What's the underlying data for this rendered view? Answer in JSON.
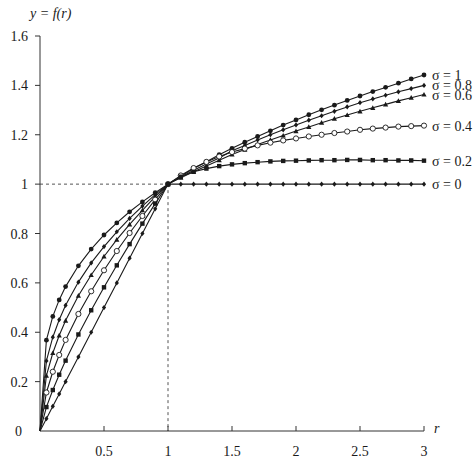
{
  "chart_data": {
    "type": "line",
    "title": "",
    "ylabel": "y = f(r)",
    "xlabel": "r",
    "xlim": [
      0,
      3
    ],
    "ylim": [
      0,
      1.6
    ],
    "x_ticks": [
      0.5,
      1,
      1.5,
      2,
      2.5,
      3
    ],
    "x_tick_labels": [
      "0.5",
      "1",
      "1.5",
      "2",
      "2.5",
      "3"
    ],
    "y_ticks": [
      0,
      0.2,
      0.4,
      0.6,
      0.8,
      1,
      1.2,
      1.4,
      1.6
    ],
    "y_tick_labels": [
      "0",
      "0.2",
      "0.4",
      "0.6",
      "0.8",
      "1",
      "1.2",
      "1.4",
      "1.6"
    ],
    "grid": false,
    "reference_lines": [
      {
        "orientation": "horizontal",
        "value": 1,
        "style": "dashed"
      },
      {
        "orientation": "vertical",
        "value": 1,
        "style": "dashed"
      }
    ],
    "legend_position": "right-end-of-lines",
    "x": [
      0,
      0.05,
      0.1,
      0.15,
      0.2,
      0.3,
      0.4,
      0.5,
      0.6,
      0.7,
      0.8,
      0.9,
      1.0,
      1.1,
      1.2,
      1.3,
      1.4,
      1.5,
      1.6,
      1.7,
      1.8,
      1.9,
      2.0,
      2.1,
      2.2,
      2.3,
      2.4,
      2.5,
      2.6,
      2.7,
      2.8,
      2.9,
      3.0
    ],
    "series": [
      {
        "name": "σ = 1",
        "marker": "filled-circle",
        "values": [
          0,
          0.368,
          0.464,
          0.531,
          0.585,
          0.669,
          0.737,
          0.794,
          0.843,
          0.888,
          0.928,
          0.965,
          1,
          1.032,
          1.063,
          1.091,
          1.119,
          1.145,
          1.17,
          1.193,
          1.216,
          1.239,
          1.26,
          1.281,
          1.301,
          1.32,
          1.339,
          1.357,
          1.375,
          1.392,
          1.409,
          1.426,
          1.442
        ]
      },
      {
        "name": "σ = 0.8",
        "marker": "filled-diamond",
        "values": [
          0,
          0.284,
          0.38,
          0.451,
          0.509,
          0.603,
          0.681,
          0.747,
          0.807,
          0.861,
          0.911,
          0.957,
          1,
          1.029,
          1.056,
          1.081,
          1.106,
          1.135,
          1.157,
          1.179,
          1.2,
          1.22,
          1.24,
          1.259,
          1.277,
          1.295,
          1.313,
          1.33,
          1.345,
          1.36,
          1.374,
          1.387,
          1.4
        ]
      },
      {
        "name": "σ = 0.6",
        "marker": "filled-triangle",
        "values": [
          0,
          0.224,
          0.316,
          0.387,
          0.447,
          0.548,
          0.632,
          0.707,
          0.775,
          0.837,
          0.894,
          0.949,
          1,
          1.026,
          1.05,
          1.073,
          1.097,
          1.12,
          1.14,
          1.16,
          1.179,
          1.197,
          1.215,
          1.232,
          1.249,
          1.265,
          1.28,
          1.295,
          1.309,
          1.323,
          1.337,
          1.35,
          1.363
        ]
      },
      {
        "name": "σ = 0.4",
        "marker": "open-circle",
        "values": [
          0,
          0.156,
          0.24,
          0.308,
          0.369,
          0.474,
          0.566,
          0.651,
          0.729,
          0.802,
          0.871,
          0.937,
          1,
          1.035,
          1.065,
          1.09,
          1.112,
          1.13,
          1.144,
          1.157,
          1.168,
          1.177,
          1.185,
          1.193,
          1.2,
          1.207,
          1.213,
          1.22,
          1.225,
          1.229,
          1.233,
          1.235,
          1.237
        ]
      },
      {
        "name": "σ = 0.2",
        "marker": "filled-square",
        "values": [
          0,
          0.097,
          0.166,
          0.228,
          0.285,
          0.391,
          0.489,
          0.582,
          0.671,
          0.757,
          0.84,
          0.921,
          1,
          1.03,
          1.05,
          1.063,
          1.073,
          1.08,
          1.085,
          1.089,
          1.092,
          1.094,
          1.095,
          1.096,
          1.097,
          1.097,
          1.098,
          1.098,
          1.097,
          1.097,
          1.096,
          1.096,
          1.095
        ]
      },
      {
        "name": "σ = 0",
        "marker": "filled-diamond",
        "values": [
          0,
          0.05,
          0.1,
          0.15,
          0.2,
          0.3,
          0.4,
          0.5,
          0.6,
          0.7,
          0.8,
          0.9,
          1,
          1,
          1,
          1,
          1,
          1,
          1,
          1,
          1,
          1,
          1,
          1,
          1,
          1,
          1,
          1,
          1,
          1,
          1,
          1,
          1
        ]
      }
    ]
  },
  "colors": {
    "line": "#1a1a1a",
    "axis": "#333333",
    "reference": "#555555",
    "background": "#ffffff"
  }
}
